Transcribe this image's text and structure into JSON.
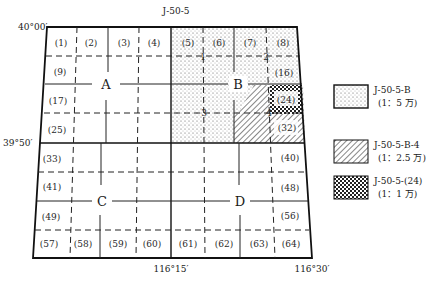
{
  "title": "J-50-5",
  "coordinates": {
    "top_left_lat": "40°00′",
    "mid_lat": "39°50′",
    "mid_lon": "116°15′",
    "right_lon": "116°30′"
  },
  "quadrants": [
    {
      "label": "A"
    },
    {
      "label": "B"
    },
    {
      "label": "C"
    },
    {
      "label": "D"
    }
  ],
  "sub_labels": [
    "1",
    "2",
    "3",
    "4"
  ],
  "cells": {
    "c1": "(1)",
    "c2": "(2)",
    "c3": "(3)",
    "c4": "(4)",
    "c5": "(5)",
    "c6": "(6)",
    "c7": "(7)",
    "c8": "(8)",
    "c9": "(9)",
    "c16": "(16)",
    "c17": "(17)",
    "c24": "(24)",
    "c25": "(25)",
    "c32": "(32)",
    "c33": "(33)",
    "c40": "(40)",
    "c41": "(41)",
    "c48": "(48)",
    "c49": "(49)",
    "c56": "(56)",
    "c57": "(57)",
    "c58": "(58)",
    "c59": "(59)",
    "c60": "(60)",
    "c61": "(61)",
    "c62": "(62)",
    "c63": "(63)",
    "c64": "(64)"
  },
  "legend": [
    {
      "pattern": "dots",
      "code": "J-50-5-B",
      "scale": "(1：5 万)"
    },
    {
      "pattern": "hatch",
      "code": "J-50-5-B-4",
      "scale": "(1：2.5 万)"
    },
    {
      "pattern": "cross",
      "code": "J-50-5-(24)",
      "scale": "(1：1 万)"
    }
  ]
}
